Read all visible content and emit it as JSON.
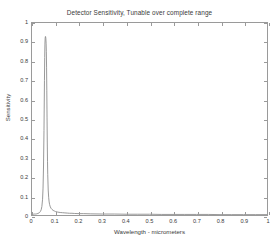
{
  "chart_data": {
    "type": "line",
    "title": "Detector Sensitivity, Tunable over complete range",
    "xlabel": "Wavelength - micrometers",
    "ylabel": "Sensitivity",
    "xlim": [
      0,
      1
    ],
    "ylim": [
      0,
      1
    ],
    "grid": false,
    "legend": null,
    "line_color": "#8c8c8c",
    "axis_color": "#9a9a9a",
    "background": "#ffffff",
    "xticks": [
      "0",
      "0.1",
      "0.2",
      "0.3",
      "0.4",
      "0.5",
      "0.6",
      "0.7",
      "0.8",
      "0.9",
      "1"
    ],
    "xtick_values": [
      0,
      0.1,
      0.2,
      0.3,
      0.4,
      0.5,
      0.6,
      0.7,
      0.8,
      0.9,
      1
    ],
    "yticks": [
      "0",
      "0.1",
      "0.2",
      "0.3",
      "0.4",
      "0.5",
      "0.6",
      "0.7",
      "0.8",
      "0.9",
      "1"
    ],
    "ytick_values": [
      0,
      0.1,
      0.2,
      0.3,
      0.4,
      0.5,
      0.6,
      0.7,
      0.8,
      0.9,
      1
    ],
    "peak": {
      "x": 0.06,
      "y": 0.93,
      "fwhm": 0.012
    },
    "series": [
      {
        "name": "Sensitivity",
        "x": [
          0.0,
          0.005,
          0.01,
          0.015,
          0.02,
          0.025,
          0.03,
          0.033,
          0.036,
          0.039,
          0.042,
          0.045,
          0.047,
          0.049,
          0.051,
          0.053,
          0.054,
          0.055,
          0.056,
          0.057,
          0.058,
          0.059,
          0.06,
          0.061,
          0.062,
          0.063,
          0.064,
          0.065,
          0.066,
          0.067,
          0.069,
          0.071,
          0.073,
          0.075,
          0.078,
          0.081,
          0.085,
          0.09,
          0.095,
          0.1,
          0.11,
          0.12,
          0.13,
          0.14,
          0.15,
          0.16,
          0.17,
          0.18,
          0.2,
          0.22,
          0.25,
          0.3,
          0.35,
          0.4,
          0.45,
          0.5,
          0.55,
          0.6,
          0.65,
          0.7,
          0.75,
          0.8,
          0.85,
          0.9,
          0.95,
          1.0
        ],
        "y": [
          0.004,
          0.004,
          0.005,
          0.005,
          0.006,
          0.008,
          0.011,
          0.014,
          0.019,
          0.027,
          0.044,
          0.082,
          0.14,
          0.25,
          0.44,
          0.7,
          0.82,
          0.89,
          0.921,
          0.93,
          0.929,
          0.918,
          0.895,
          0.85,
          0.77,
          0.65,
          0.51,
          0.38,
          0.28,
          0.21,
          0.13,
          0.09,
          0.068,
          0.054,
          0.042,
          0.035,
          0.029,
          0.024,
          0.021,
          0.018,
          0.015,
          0.013,
          0.012,
          0.011,
          0.01,
          0.009,
          0.009,
          0.008,
          0.007,
          0.007,
          0.006,
          0.005,
          0.005,
          0.004,
          0.004,
          0.004,
          0.003,
          0.003,
          0.003,
          0.003,
          0.003,
          0.002,
          0.002,
          0.002,
          0.002,
          0.002
        ]
      }
    ]
  }
}
